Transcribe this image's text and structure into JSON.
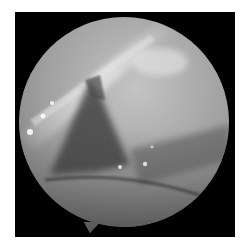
{
  "image": {
    "kind": "endoscopic-view",
    "description": "Circular grayscale arthroscopic/endoscopic field of view on black square background",
    "colors": {
      "background": "#ffffff",
      "frame": "#000000",
      "tissue_light": "#c8c8c8",
      "tissue_mid": "#8a8a8a",
      "tissue_dark": "#3a3a3a"
    }
  }
}
